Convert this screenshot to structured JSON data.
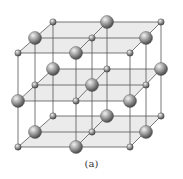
{
  "figure": {
    "caption": "(a)"
  },
  "colors": {
    "plane_fill": "#e4e4e4",
    "edge": "#555555",
    "sphere_light": "#e8e8e8",
    "sphere_dark": "#5a5a5a"
  },
  "lattice": {
    "large_spheres": [
      [
        107,
        22
      ],
      [
        35,
        38
      ],
      [
        146,
        38
      ],
      [
        76,
        53
      ],
      [
        53,
        69
      ],
      [
        161,
        69
      ],
      [
        92,
        85
      ],
      [
        18,
        101
      ],
      [
        130,
        101
      ],
      [
        107,
        116
      ],
      [
        35,
        132
      ],
      [
        146,
        132
      ],
      [
        76,
        147
      ]
    ],
    "small_spheres": [
      [
        53,
        22
      ],
      [
        161,
        22
      ],
      [
        92,
        38
      ],
      [
        18,
        53
      ],
      [
        130,
        53
      ],
      [
        107,
        69
      ],
      [
        35,
        85
      ],
      [
        146,
        85
      ],
      [
        76,
        101
      ],
      [
        53,
        116
      ],
      [
        161,
        116
      ],
      [
        92,
        132
      ],
      [
        18,
        147
      ],
      [
        130,
        147
      ]
    ],
    "large_radius": 6.5,
    "small_radius": 3.2
  }
}
